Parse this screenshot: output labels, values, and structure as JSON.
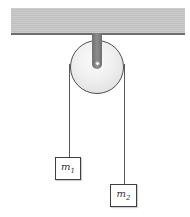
{
  "figure": {
    "type": "physics-diagram",
    "labels": {
      "m1": {
        "base": "m",
        "sub": "1"
      },
      "m2": {
        "base": "m",
        "sub": "2"
      }
    },
    "colors": {
      "background": "#ffffff",
      "ceiling_fill": "#c9c9c9",
      "ceiling_edge": "#6e6e6e",
      "bracket_fill": "#7f7f7f",
      "pulley_fill": "#ececec",
      "pulley_outline": "#4d4d4d",
      "axle_fill": "#f5f5f5",
      "string": "#5a5a5a",
      "box_outline": "#3f3f3f",
      "label_text": "#333333"
    }
  }
}
